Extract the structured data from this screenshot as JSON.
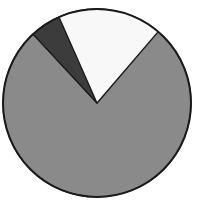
{
  "chart_data": {
    "type": "pie",
    "title": "",
    "legend": [],
    "start_angle_deg": 40.6,
    "direction": "clockwise",
    "slices": [
      {
        "name": "gray",
        "value": 76.8,
        "color": "#8a8a8a"
      },
      {
        "name": "dark",
        "value": 5.3,
        "color": "#3c3c3c"
      },
      {
        "name": "white",
        "value": 17.9,
        "color": "#f8f8f8"
      }
    ],
    "stroke_color": "#1a1a1a"
  }
}
